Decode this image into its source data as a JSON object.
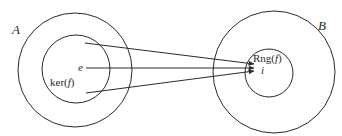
{
  "diagram": {
    "sets": [
      {
        "name": "A",
        "label": "A",
        "subset_label": "ker(f)",
        "element": "e"
      },
      {
        "name": "B",
        "label": "B",
        "subset_label": "Rng(f)",
        "element": "i"
      }
    ],
    "labels": {
      "set_a": "A",
      "set_b": "B",
      "kernel_prefix": "ker(",
      "kernel_f": "f",
      "kernel_suffix": ")",
      "range_prefix": "Rng(",
      "range_f": "f",
      "range_suffix": ")",
      "identity_a": "e",
      "identity_b": "i"
    },
    "arrows": [
      {
        "from": "ker(f) upper point",
        "to": "i"
      },
      {
        "from": "e",
        "to": "i"
      },
      {
        "from": "ker(f) lower point",
        "to": "i"
      }
    ],
    "colors": {
      "stroke": "#2a2a2a",
      "background": "#ffffff"
    }
  }
}
